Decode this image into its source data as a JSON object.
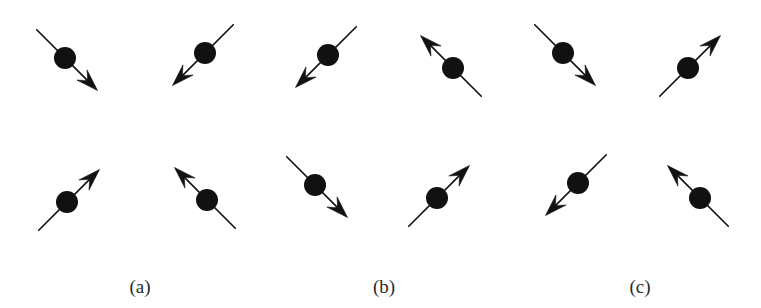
{
  "figure": {
    "background_color": "#ffffff",
    "ink_color": "#111111",
    "width": 761,
    "height": 308,
    "site_radius": 11,
    "arrow_half_length": 46,
    "tail_overshoot": 40
  },
  "panels": [
    {
      "id": "a",
      "label": "(a)",
      "label_x": 140,
      "label_y": 277,
      "description": "all-in: every arrow points toward the plaquette centre",
      "spins": [
        {
          "name": "top-left",
          "cx": 65,
          "cy": 58,
          "angle_deg": 35,
          "direction": "southeast",
          "arrow_dx": 1,
          "arrow_dy": 1
        },
        {
          "name": "top-right",
          "cx": 205,
          "cy": 53,
          "angle_deg": 215,
          "direction": "southwest",
          "arrow_dx": -1,
          "arrow_dy": 1
        },
        {
          "name": "bottom-left",
          "cx": 67,
          "cy": 202,
          "angle_deg": 325,
          "direction": "northeast",
          "arrow_dx": 1,
          "arrow_dy": -1
        },
        {
          "name": "bottom-right",
          "cx": 207,
          "cy": 200,
          "angle_deg": 145,
          "direction": "northwest",
          "arrow_dx": -1,
          "arrow_dy": -1
        }
      ]
    },
    {
      "id": "b",
      "label": "(b)",
      "label_x": 384,
      "label_y": 277,
      "description": "all-out: every arrow points away from the plaquette centre",
      "spins": [
        {
          "name": "top-left",
          "cx": 328,
          "cy": 55,
          "angle_deg": 215,
          "direction": "southwest",
          "arrow_dx": -1,
          "arrow_dy": 1
        },
        {
          "name": "top-right",
          "cx": 453,
          "cy": 68,
          "angle_deg": 145,
          "direction": "northwest",
          "arrow_dx": -1,
          "arrow_dy": -1
        },
        {
          "name": "bottom-left",
          "cx": 315,
          "cy": 185,
          "angle_deg": 35,
          "direction": "southeast",
          "arrow_dx": 1,
          "arrow_dy": 1
        },
        {
          "name": "bottom-right",
          "cx": 437,
          "cy": 198,
          "angle_deg": 325,
          "direction": "northeast",
          "arrow_dx": 1,
          "arrow_dy": -1
        }
      ]
    },
    {
      "id": "c",
      "label": "(c)",
      "label_x": 640,
      "label_y": 277,
      "description": "two-in two-out: arrows alternate along the diagonals",
      "spins": [
        {
          "name": "top-left",
          "cx": 563,
          "cy": 53,
          "angle_deg": 35,
          "direction": "southeast",
          "arrow_dx": 1,
          "arrow_dy": 1
        },
        {
          "name": "top-right",
          "cx": 688,
          "cy": 68,
          "angle_deg": 325,
          "direction": "northeast",
          "arrow_dx": 1,
          "arrow_dy": -1
        },
        {
          "name": "bottom-left",
          "cx": 578,
          "cy": 183,
          "angle_deg": 215,
          "direction": "southwest",
          "arrow_dx": -1,
          "arrow_dy": 1
        },
        {
          "name": "bottom-right",
          "cx": 700,
          "cy": 198,
          "angle_deg": 145,
          "direction": "northwest",
          "arrow_dx": -1,
          "arrow_dy": -1
        }
      ]
    }
  ]
}
